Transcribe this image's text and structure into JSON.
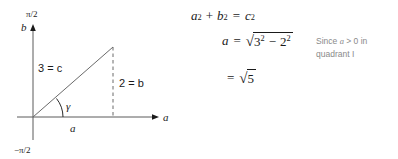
{
  "figure": {
    "type": "right-triangle-diagram-with-derivation",
    "background_color": "#ffffff",
    "ink_color": "#1a1a1a",
    "annotation_color": "#8a8a8a"
  },
  "diagram": {
    "y_axis": {
      "name": "vertical-axis",
      "label": "b",
      "top_tick_label": "π/2",
      "bottom_tick_label": "−π/2",
      "has_arrow": true
    },
    "x_axis": {
      "name": "horizontal-axis",
      "label": "a",
      "has_arrow": true
    },
    "triangle": {
      "hypotenuse_label": "3 = c",
      "opposite_label": "2 = b",
      "adjacent_label": "a",
      "angle_label": "γ",
      "opposite_side_style": "dashed",
      "quadrant": "I"
    }
  },
  "equations": {
    "line1": {
      "lhs": [
        {
          "kind": "var",
          "text": "a",
          "exp": "2"
        },
        {
          "kind": "op",
          "text": "+"
        },
        {
          "kind": "var",
          "text": "b",
          "exp": "2"
        }
      ],
      "rel": "=",
      "rhs": [
        {
          "kind": "var",
          "text": "c",
          "exp": "2"
        }
      ],
      "plain": "a² + b² = c²"
    },
    "line2": {
      "lhs": "a",
      "rel": "=",
      "radical_terms": [
        {
          "kind": "num",
          "text": "3",
          "exp": "2"
        },
        {
          "kind": "op",
          "text": "−"
        },
        {
          "kind": "num",
          "text": "2",
          "exp": "2"
        }
      ],
      "plain": "a = √(3² − 2²)"
    },
    "line3": {
      "lhs": "",
      "rel": "=",
      "radicand": "5",
      "plain": "= √5"
    }
  },
  "annotation": {
    "name": "justification-note",
    "prefix": "Since ",
    "variable": "a",
    "relation": " > 0",
    "suffix": " in",
    "second_line": "quadrant I",
    "plain": "Since a > 0 in quadrant I"
  }
}
